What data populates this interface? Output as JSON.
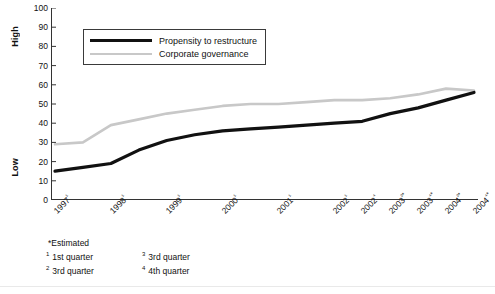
{
  "chart_data": {
    "type": "line",
    "title": "",
    "xlabel": "",
    "ylabel": "",
    "ylim": [
      0,
      100
    ],
    "grid": false,
    "legend_position": "top-left-inside",
    "y_axis_high_label": "High",
    "y_axis_low_label": "Low",
    "yticks": [
      100,
      90,
      80,
      70,
      60,
      50,
      40,
      30,
      20,
      10,
      0
    ],
    "categories": [
      "1997¹",
      "1997³",
      "1998¹",
      "1998³",
      "1999¹",
      "1999³",
      "2000¹",
      "2000³",
      "2001¹",
      "2001³",
      "2002¹",
      "2002⁴",
      "2003²*",
      "2003⁴*",
      "2004²*",
      "2004⁴*"
    ],
    "tick_labels_shown": [
      "1997¹",
      "1998¹",
      "1999¹",
      "2000¹",
      "2001¹",
      "2002¹",
      "2002⁴",
      "2003²*",
      "2003⁴*",
      "2004²*",
      "2004⁴*"
    ],
    "series": [
      {
        "name": "Propensity to restructure",
        "color": "#111111",
        "values": [
          15,
          17,
          19,
          26,
          31,
          34,
          36,
          37,
          38,
          39,
          40,
          41,
          45,
          48,
          52,
          56
        ]
      },
      {
        "name": "Corporate governance",
        "color": "#c8c8c8",
        "values": [
          29,
          30,
          39,
          42,
          45,
          47,
          49,
          50,
          50,
          51,
          52,
          52,
          53,
          55,
          58,
          57
        ]
      }
    ]
  },
  "legend": {
    "items": [
      {
        "label": "Propensity to restructure",
        "color": "#111111",
        "width": 3.2
      },
      {
        "label": "Corporate governance",
        "color": "#c8c8c8",
        "width": 2.4
      }
    ]
  },
  "footnotes": {
    "estimated": "*Estimated",
    "items": [
      {
        "marker": "1",
        "text": "1st quarter"
      },
      {
        "marker": "3",
        "text": "3rd quarter"
      },
      {
        "marker": "2",
        "text": "3rd quarter"
      },
      {
        "marker": "4",
        "text": "4th quarter"
      }
    ]
  }
}
